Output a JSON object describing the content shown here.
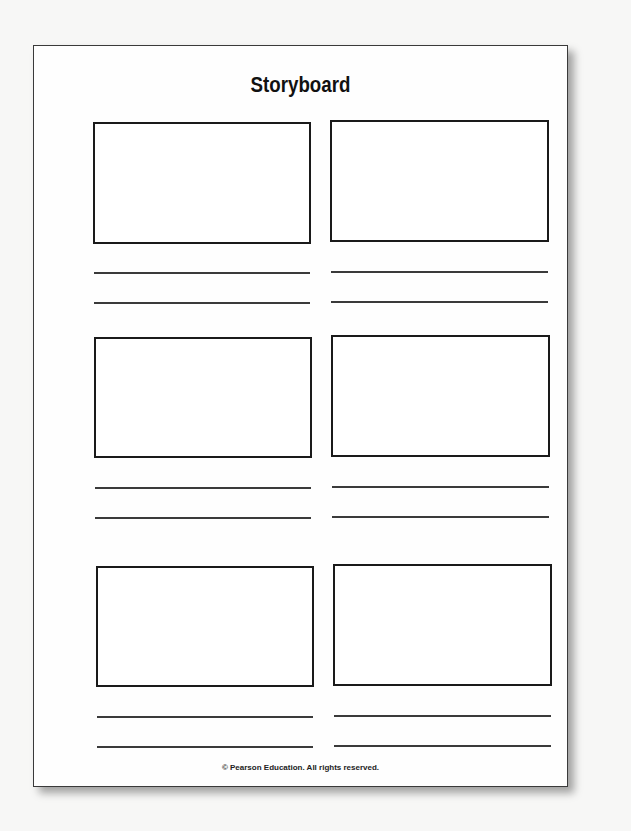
{
  "document": {
    "title": "Storyboard",
    "footer": "© Pearson Education. All rights reserved.",
    "layout": {
      "rows": 3,
      "columns": 2,
      "caption_lines_per_panel": 2
    },
    "panels": [
      {
        "row": 1,
        "column": 1,
        "caption_lines": [
          "",
          ""
        ]
      },
      {
        "row": 1,
        "column": 2,
        "caption_lines": [
          "",
          ""
        ]
      },
      {
        "row": 2,
        "column": 1,
        "caption_lines": [
          "",
          ""
        ]
      },
      {
        "row": 2,
        "column": 2,
        "caption_lines": [
          "",
          ""
        ]
      },
      {
        "row": 3,
        "column": 1,
        "caption_lines": [
          "",
          ""
        ]
      },
      {
        "row": 3,
        "column": 2,
        "caption_lines": [
          "",
          ""
        ]
      }
    ]
  }
}
